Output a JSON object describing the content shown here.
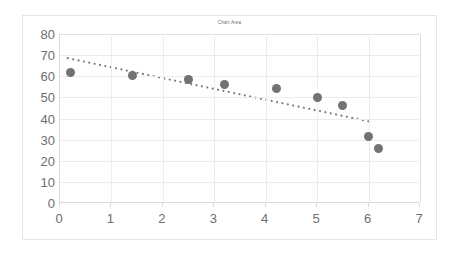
{
  "chart_data": {
    "type": "scatter",
    "title": "Chart Area",
    "xlabel": "",
    "ylabel": "",
    "xlim": [
      0,
      7
    ],
    "ylim": [
      0,
      80
    ],
    "x_ticks": [
      0,
      1,
      2,
      3,
      4,
      5,
      6,
      7
    ],
    "y_ticks": [
      0,
      10,
      20,
      30,
      40,
      50,
      60,
      70,
      80
    ],
    "grid": true,
    "legend": false,
    "marker_color": "#767171",
    "trendline_color": "#808080",
    "series": [
      {
        "name": "Series 1",
        "points": [
          {
            "x": 0.2,
            "y": 62.0
          },
          {
            "x": 1.4,
            "y": 60.5
          },
          {
            "x": 2.5,
            "y": 58.5
          },
          {
            "x": 3.2,
            "y": 56.3
          },
          {
            "x": 4.2,
            "y": 54.0
          },
          {
            "x": 5.0,
            "y": 50.0
          },
          {
            "x": 5.5,
            "y": 46.0
          },
          {
            "x": 6.0,
            "y": 31.5
          },
          {
            "x": 6.2,
            "y": 26.0
          }
        ]
      }
    ],
    "trendline": {
      "type": "linear-dotted",
      "x_start": 0.15,
      "y_start": 68.5,
      "x_end": 6.1,
      "y_end": 38.0
    }
  }
}
